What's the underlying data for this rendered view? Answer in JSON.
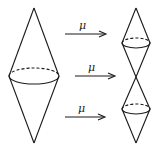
{
  "diagram": {
    "stroke_color": "#1a1a1a",
    "left_shape": {
      "type": "double-cone",
      "top_apex": [
        34,
        8
      ],
      "bottom_apex": [
        34,
        143
      ],
      "ellipse": {
        "cx": 34,
        "cy": 76,
        "rx": 25,
        "ry": 8
      }
    },
    "right_shape": {
      "type": "stacked-double-cones",
      "top_apex": [
        136,
        8
      ],
      "middle_vertex": [
        136,
        77
      ],
      "bottom_apex": [
        136,
        143
      ],
      "upper_ellipse": {
        "cx": 136,
        "cy": 43,
        "rx": 14,
        "ry": 5
      },
      "lower_ellipse": {
        "cx": 136,
        "cy": 109,
        "rx": 14,
        "ry": 5
      }
    },
    "arrows": [
      {
        "label": "μ",
        "x1": 65,
        "x2": 106,
        "y": 34
      },
      {
        "label": "μ",
        "x1": 75,
        "x2": 115,
        "y": 76
      },
      {
        "label": "μ",
        "x1": 65,
        "x2": 105,
        "y": 117
      }
    ]
  }
}
